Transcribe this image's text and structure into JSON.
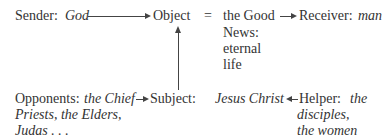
{
  "diagram": {
    "sender": {
      "label": "Sender:",
      "value": "God"
    },
    "object": {
      "label": "Object",
      "equals": "=",
      "value_lines": [
        "the Good",
        "News:",
        "eternal",
        "life"
      ]
    },
    "receiver": {
      "label": "Receiver:",
      "value": "man"
    },
    "opponents": {
      "label": "Opponents:",
      "value_lines": [
        "the Chief",
        "Priests, the Elders,",
        "Judas . . ."
      ]
    },
    "subject": {
      "label": "Subject:",
      "value": "Jesus Christ"
    },
    "helper": {
      "label": "Helper:",
      "value_lines": [
        "the",
        "disciples,",
        "the women"
      ]
    },
    "arrows": [
      {
        "from": "sender",
        "to": "object"
      },
      {
        "from": "object",
        "to": "receiver"
      },
      {
        "from": "subject",
        "to": "object"
      },
      {
        "from": "opponents",
        "to": "subject"
      },
      {
        "from": "helper",
        "to": "subject"
      }
    ]
  }
}
